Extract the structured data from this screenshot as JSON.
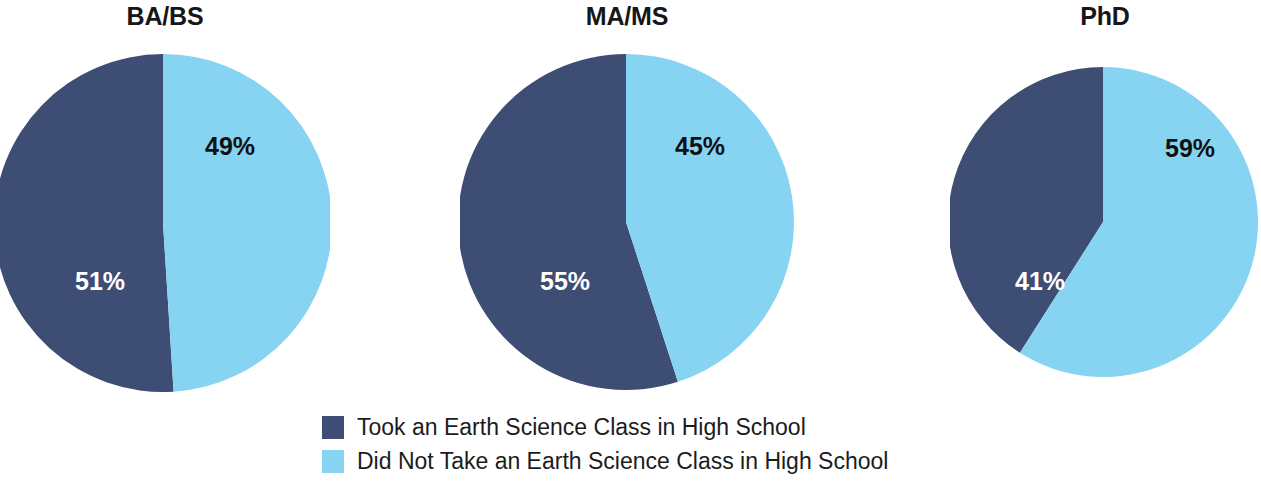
{
  "chart_data": {
    "type": "pie",
    "title": "",
    "subtitle": "",
    "xlabel": "",
    "ylabel": "",
    "grid": false,
    "legend_position": "bottom",
    "value_unit": "%",
    "colors": {
      "took_class": "#3d4d73",
      "did_not_take_class": "#87d3f2",
      "background": "#ffffff",
      "label_on_dark": "#ffffff",
      "label_on_light": "#101010",
      "title_text": "#161616",
      "legend_text": "#1c1c1c"
    },
    "legend": [
      {
        "key": "took_class",
        "label": "Took an Earth Science Class in High School",
        "color": "#3d4d73"
      },
      {
        "key": "did_not_take_class",
        "label": "Did Not Take an Earth Science Class in High School",
        "color": "#87d3f2"
      }
    ],
    "charts": [
      {
        "title": "BA/BS",
        "categories": [
          "Took an Earth Science Class in High School",
          "Did Not Take an Earth Science Class in High School"
        ],
        "values": [
          51,
          49
        ],
        "labels": [
          "51%",
          "49%"
        ]
      },
      {
        "title": "MA/MS",
        "categories": [
          "Took an Earth Science Class in High School",
          "Did Not Take an Earth Science Class in High School"
        ],
        "values": [
          55,
          45
        ],
        "labels": [
          "55%",
          "45%"
        ]
      },
      {
        "title": "PhD",
        "categories": [
          "Took an Earth Science Class in High School",
          "Did Not Take an Earth Science Class in High School"
        ],
        "values": [
          41,
          59
        ],
        "labels": [
          "41%",
          "59%"
        ]
      }
    ]
  }
}
